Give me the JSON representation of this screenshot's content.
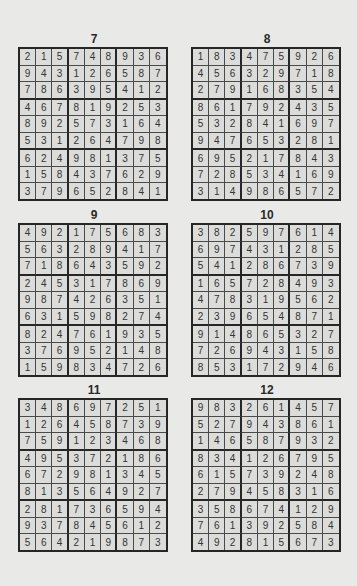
{
  "puzzles": [
    {
      "title": "7",
      "grid": [
        [
          2,
          1,
          5,
          7,
          4,
          8,
          9,
          3,
          6
        ],
        [
          9,
          4,
          3,
          1,
          2,
          6,
          5,
          8,
          7
        ],
        [
          7,
          8,
          6,
          3,
          9,
          5,
          4,
          1,
          2
        ],
        [
          4,
          6,
          7,
          8,
          1,
          9,
          2,
          5,
          3
        ],
        [
          8,
          9,
          2,
          5,
          7,
          3,
          1,
          6,
          4
        ],
        [
          5,
          3,
          1,
          2,
          6,
          4,
          7,
          9,
          8
        ],
        [
          6,
          2,
          4,
          9,
          8,
          1,
          3,
          7,
          5
        ],
        [
          1,
          5,
          8,
          4,
          3,
          7,
          6,
          2,
          9
        ],
        [
          3,
          7,
          9,
          6,
          5,
          2,
          8,
          4,
          1
        ]
      ]
    },
    {
      "title": "8",
      "grid": [
        [
          1,
          8,
          3,
          4,
          7,
          5,
          9,
          2,
          6
        ],
        [
          4,
          5,
          6,
          3,
          2,
          9,
          7,
          1,
          8
        ],
        [
          2,
          7,
          9,
          1,
          6,
          8,
          3,
          5,
          4
        ],
        [
          8,
          6,
          1,
          7,
          9,
          2,
          4,
          3,
          5
        ],
        [
          5,
          3,
          2,
          8,
          4,
          1,
          6,
          9,
          7
        ],
        [
          9,
          4,
          7,
          6,
          5,
          3,
          2,
          8,
          1
        ],
        [
          6,
          9,
          5,
          2,
          1,
          7,
          8,
          4,
          3
        ],
        [
          7,
          2,
          8,
          5,
          3,
          4,
          1,
          6,
          9
        ],
        [
          3,
          1,
          4,
          9,
          8,
          6,
          5,
          7,
          2
        ]
      ]
    },
    {
      "title": "9",
      "grid": [
        [
          4,
          9,
          2,
          1,
          7,
          5,
          6,
          8,
          3
        ],
        [
          5,
          6,
          3,
          2,
          8,
          9,
          4,
          1,
          7
        ],
        [
          7,
          1,
          8,
          6,
          4,
          3,
          5,
          9,
          2
        ],
        [
          2,
          4,
          5,
          3,
          1,
          7,
          8,
          6,
          9
        ],
        [
          9,
          8,
          7,
          4,
          2,
          6,
          3,
          5,
          1
        ],
        [
          6,
          3,
          1,
          5,
          9,
          8,
          2,
          7,
          4
        ],
        [
          8,
          2,
          4,
          7,
          6,
          1,
          9,
          3,
          5
        ],
        [
          3,
          7,
          6,
          9,
          5,
          2,
          1,
          4,
          8
        ],
        [
          1,
          5,
          9,
          8,
          3,
          4,
          7,
          2,
          6
        ]
      ]
    },
    {
      "title": "10",
      "grid": [
        [
          3,
          8,
          2,
          5,
          9,
          7,
          6,
          1,
          4
        ],
        [
          6,
          9,
          7,
          4,
          3,
          1,
          2,
          8,
          5
        ],
        [
          5,
          4,
          1,
          2,
          8,
          6,
          7,
          3,
          9
        ],
        [
          1,
          6,
          5,
          7,
          2,
          8,
          4,
          9,
          3
        ],
        [
          4,
          7,
          8,
          3,
          1,
          9,
          5,
          6,
          2
        ],
        [
          2,
          3,
          9,
          6,
          5,
          4,
          8,
          7,
          1
        ],
        [
          9,
          1,
          4,
          8,
          6,
          5,
          3,
          2,
          7
        ],
        [
          7,
          2,
          6,
          9,
          4,
          3,
          1,
          5,
          8
        ],
        [
          8,
          5,
          3,
          1,
          7,
          2,
          9,
          4,
          6
        ]
      ]
    },
    {
      "title": "11",
      "grid": [
        [
          3,
          4,
          8,
          6,
          9,
          7,
          2,
          5,
          1
        ],
        [
          1,
          2,
          6,
          4,
          5,
          8,
          7,
          3,
          9
        ],
        [
          7,
          5,
          9,
          1,
          2,
          3,
          4,
          6,
          8
        ],
        [
          4,
          9,
          5,
          3,
          7,
          2,
          1,
          8,
          6
        ],
        [
          6,
          7,
          2,
          9,
          8,
          1,
          3,
          4,
          5
        ],
        [
          8,
          1,
          3,
          5,
          6,
          4,
          9,
          2,
          7
        ],
        [
          2,
          8,
          1,
          7,
          3,
          6,
          5,
          9,
          4
        ],
        [
          9,
          3,
          7,
          8,
          4,
          5,
          6,
          1,
          2
        ],
        [
          5,
          6,
          4,
          2,
          1,
          9,
          8,
          7,
          3
        ]
      ]
    },
    {
      "title": "12",
      "grid": [
        [
          9,
          8,
          3,
          2,
          6,
          1,
          4,
          5,
          7
        ],
        [
          5,
          2,
          7,
          9,
          4,
          3,
          8,
          6,
          1
        ],
        [
          1,
          4,
          6,
          5,
          8,
          7,
          9,
          3,
          2
        ],
        [
          8,
          3,
          4,
          1,
          2,
          6,
          7,
          9,
          5
        ],
        [
          6,
          1,
          5,
          7,
          3,
          9,
          2,
          4,
          8
        ],
        [
          2,
          7,
          9,
          4,
          5,
          8,
          3,
          1,
          6
        ],
        [
          3,
          5,
          8,
          6,
          7,
          4,
          1,
          2,
          9
        ],
        [
          7,
          6,
          1,
          3,
          9,
          2,
          5,
          8,
          4
        ],
        [
          4,
          9,
          2,
          8,
          1,
          5,
          6,
          7,
          3
        ]
      ]
    }
  ]
}
